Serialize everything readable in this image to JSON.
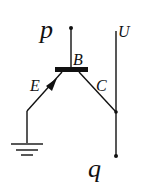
{
  "diagram": {
    "labels": {
      "p": "p",
      "q": "q",
      "U": "U",
      "B": "B",
      "E": "E",
      "C": "C"
    },
    "colors": {
      "stroke": "#111111",
      "background": "#ffffff"
    }
  }
}
